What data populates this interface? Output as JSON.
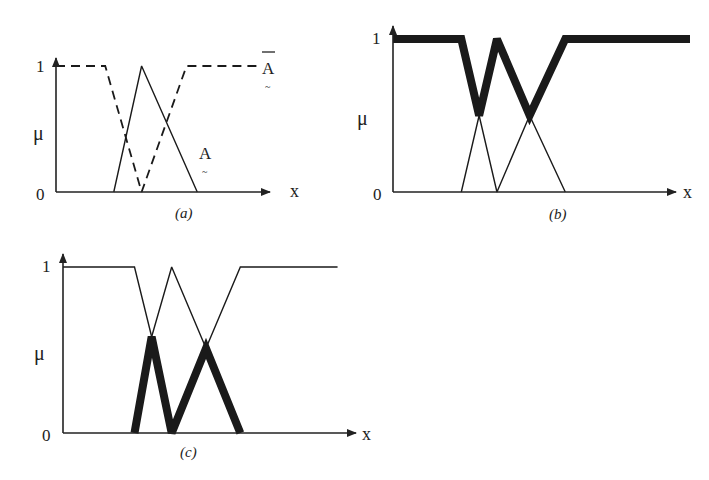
{
  "figure": {
    "panels": [
      {
        "id": "a",
        "caption": "(a)",
        "y_top_label": "1",
        "y_bottom_label": "0",
        "y_axis_label": "μ",
        "x_axis_label": "x",
        "curves": [
          {
            "name": "A",
            "label": "A",
            "label_mark": "~",
            "style": "solid-thin",
            "points": [
              [
                2.7,
                0
              ],
              [
                4.0,
                1
              ],
              [
                6.6,
                0
              ]
            ]
          },
          {
            "name": "A-complement",
            "label": "A",
            "label_mark": "~",
            "label_overbar": true,
            "style": "dashed",
            "points": [
              [
                0,
                1
              ],
              [
                2.3,
                1
              ],
              [
                4.0,
                0
              ],
              [
                6.1,
                1
              ],
              [
                9.4,
                1
              ]
            ]
          }
        ]
      },
      {
        "id": "b",
        "caption": "(b)",
        "y_top_label": "1",
        "y_bottom_label": "0",
        "y_axis_label": "μ",
        "x_axis_label": "x",
        "curves": [
          {
            "name": "A",
            "style": "solid-thin",
            "points": [
              [
                2.3,
                0
              ],
              [
                2.9,
                0.5
              ],
              [
                3.5,
                1
              ],
              [
                4.6,
                0.5
              ],
              [
                5.8,
                0
              ]
            ]
          },
          {
            "name": "A-complement",
            "style": "solid-thin",
            "points": [
              [
                2.3,
                1
              ],
              [
                2.9,
                0.5
              ],
              [
                3.5,
                0
              ],
              [
                4.6,
                0.5
              ],
              [
                5.8,
                1
              ]
            ]
          },
          {
            "name": "union",
            "style": "solid-thick",
            "points": [
              [
                0,
                1
              ],
              [
                2.3,
                1
              ],
              [
                2.9,
                0.5
              ],
              [
                3.5,
                1
              ],
              [
                4.6,
                0.5
              ],
              [
                5.8,
                1
              ],
              [
                10,
                1
              ]
            ]
          }
        ]
      },
      {
        "id": "c",
        "caption": "(c)",
        "y_top_label": "1",
        "y_bottom_label": "0",
        "y_axis_label": "μ",
        "x_axis_label": "x",
        "curves": [
          {
            "name": "A",
            "style": "solid-thin",
            "points": [
              [
                2.5,
                0
              ],
              [
                3.1,
                0.58
              ],
              [
                3.8,
                1
              ],
              [
                5.0,
                0.51
              ],
              [
                6.2,
                0
              ]
            ]
          },
          {
            "name": "A-complement",
            "style": "solid-thin",
            "points": [
              [
                0,
                1
              ],
              [
                2.5,
                1
              ],
              [
                3.1,
                0.58
              ],
              [
                3.8,
                0
              ],
              [
                5.0,
                0.51
              ],
              [
                6.2,
                1
              ],
              [
                9.6,
                1
              ]
            ]
          },
          {
            "name": "intersection",
            "style": "solid-thick",
            "points": [
              [
                2.5,
                0
              ],
              [
                3.1,
                0.58
              ],
              [
                3.8,
                0
              ],
              [
                5.0,
                0.51
              ],
              [
                6.2,
                0
              ]
            ]
          }
        ]
      }
    ]
  }
}
